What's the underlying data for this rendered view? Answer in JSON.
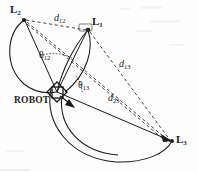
{
  "figure": {
    "background_color": "#fdfdfd",
    "ink_color": "#1a1a1a"
  },
  "landmarks": [
    {
      "id": "L1",
      "base": "L",
      "subscript": "1",
      "label_x": 92,
      "label_y": 16,
      "point_x": 88,
      "point_y": 30
    },
    {
      "id": "L2",
      "base": "L",
      "subscript": "2",
      "label_x": 10,
      "label_y": 4,
      "point_x": 24,
      "point_y": 20
    },
    {
      "id": "L3",
      "base": "L",
      "subscript": "3",
      "label_x": 176,
      "label_y": 134,
      "point_x": 172,
      "point_y": 141
    }
  ],
  "robot": {
    "label": "ROBOT",
    "label_x": 14,
    "label_y": 96,
    "point_x": 57,
    "point_y": 92,
    "heading_arrow_tip_x": 74,
    "heading_arrow_tip_y": 107
  },
  "distances": [
    {
      "id": "d12",
      "base": "d",
      "subscript": "12",
      "label_x": 54,
      "label_y": 13,
      "from": "L1",
      "to": "L2",
      "style": "dashed"
    },
    {
      "id": "d13",
      "base": "d",
      "subscript": "13",
      "label_x": 119,
      "label_y": 59,
      "from": "L1",
      "to": "L3",
      "style": "dashed"
    },
    {
      "id": "d23",
      "base": "d",
      "subscript": "23",
      "label_x": 108,
      "label_y": 93,
      "from": "L2",
      "to": "L3",
      "style": "dashed"
    }
  ],
  "angles": [
    {
      "id": "theta12",
      "base": "θ",
      "subscript": "12",
      "label_x": 39,
      "label_y": 50,
      "between": "L1-L2"
    },
    {
      "id": "theta13",
      "base": "θ",
      "subscript": "13",
      "label_x": 78,
      "label_y": 80,
      "between": "L1-L3"
    }
  ],
  "arcs": [
    {
      "id": "arc-12",
      "description": "constant-angle locus through L1, L2 and robot"
    },
    {
      "id": "arc-13",
      "description": "constant-angle locus through L1, L3 and robot"
    }
  ]
}
